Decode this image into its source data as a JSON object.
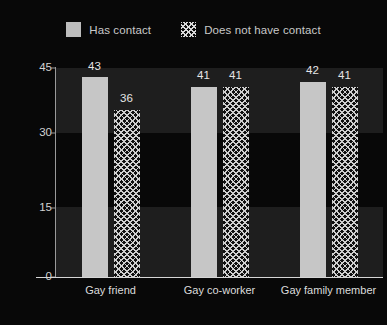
{
  "legend": {
    "entries": [
      {
        "label": "Has contact",
        "swatch": "solid-square-icon",
        "color": "#bdbdbd"
      },
      {
        "label": "Does not have contact",
        "swatch": "crosshatch-square-icon",
        "color": "#d9d9d9"
      }
    ]
  },
  "chart_data": {
    "type": "bar",
    "title": "",
    "xlabel": "",
    "ylabel": "",
    "ylim": [
      0,
      45
    ],
    "yticks": [
      0,
      15,
      30,
      45
    ],
    "grid": false,
    "legend_position": "top-center",
    "categories": [
      "Gay friend",
      "Gay co-worker",
      "Gay family member"
    ],
    "series": [
      {
        "name": "Has contact",
        "values": [
          43,
          41,
          42
        ],
        "fill": "solid",
        "color": "#c6c6c6"
      },
      {
        "name": "Does not have contact",
        "values": [
          36,
          41,
          41
        ],
        "fill": "crosshatch",
        "color": "#cfcfcf"
      }
    ],
    "data_labels": [
      {
        "category": "Gay friend",
        "has_contact": 43,
        "does_not_have_contact": 36
      },
      {
        "category": "Gay co-worker",
        "has_contact": 41,
        "does_not_have_contact": 41
      },
      {
        "category": "Gay family member",
        "has_contact": 42,
        "does_not_have_contact": 41
      }
    ]
  },
  "axis": {
    "ytick_labels": [
      "45",
      "30",
      "15",
      "0"
    ]
  }
}
